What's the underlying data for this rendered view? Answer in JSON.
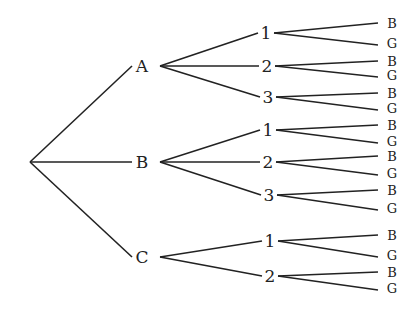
{
  "diagram": {
    "type": "tree",
    "root": {
      "x": 30,
      "y": 162
    },
    "level1": [
      {
        "label": "A",
        "x": 142,
        "y": 66
      },
      {
        "label": "B",
        "x": 142,
        "y": 162
      },
      {
        "label": "C",
        "x": 142,
        "y": 257
      }
    ],
    "level2": [
      {
        "parent": "A",
        "label": "1",
        "x": 266,
        "y": 33
      },
      {
        "parent": "A",
        "label": "2",
        "x": 267,
        "y": 66
      },
      {
        "parent": "A",
        "label": "3",
        "x": 268,
        "y": 97
      },
      {
        "parent": "B",
        "label": "1",
        "x": 268,
        "y": 130
      },
      {
        "parent": "B",
        "label": "2",
        "x": 268,
        "y": 162
      },
      {
        "parent": "B",
        "label": "3",
        "x": 269,
        "y": 195
      },
      {
        "parent": "C",
        "label": "1",
        "x": 270,
        "y": 241
      },
      {
        "parent": "C",
        "label": "2",
        "x": 270,
        "y": 276
      }
    ],
    "leaves": [
      {
        "label": "B",
        "y": 23
      },
      {
        "label": "G",
        "y": 43
      },
      {
        "label": "B",
        "y": 61
      },
      {
        "label": "G",
        "y": 75
      },
      {
        "label": "B",
        "y": 93
      },
      {
        "label": "G",
        "y": 108
      },
      {
        "label": "B",
        "y": 125
      },
      {
        "label": "G",
        "y": 141
      },
      {
        "label": "B",
        "y": 156
      },
      {
        "label": "G",
        "y": 173
      },
      {
        "label": "B",
        "y": 190
      },
      {
        "label": "G",
        "y": 208
      },
      {
        "label": "B",
        "y": 235
      },
      {
        "label": "G",
        "y": 255
      },
      {
        "label": "B",
        "y": 272
      },
      {
        "label": "G",
        "y": 288
      }
    ],
    "line_color": "#222222"
  }
}
